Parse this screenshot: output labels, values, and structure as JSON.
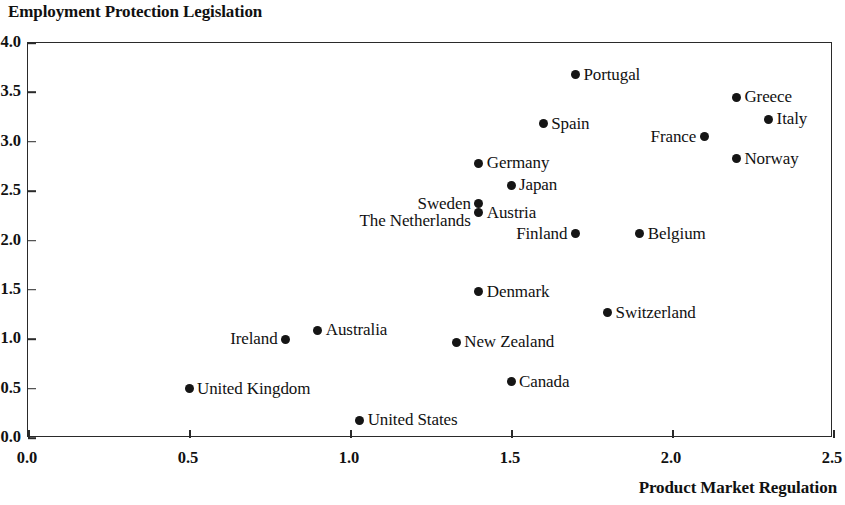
{
  "chart_data": {
    "type": "scatter",
    "title": "Employment Protection Legislation",
    "xlabel": "Product Market Regulation",
    "ylabel": "Employment Protection Legislation",
    "xlim": [
      0.0,
      2.5
    ],
    "ylim": [
      0.0,
      4.0
    ],
    "xticks": [
      "0.0",
      "0.5",
      "1.0",
      "1.5",
      "2.0",
      "2.5"
    ],
    "yticks": [
      "0.0",
      "0.5",
      "1.0",
      "1.5",
      "2.0",
      "2.5",
      "3.0",
      "3.5",
      "4.0"
    ],
    "grid": false,
    "legend": "none",
    "marker_color": "#151515",
    "axis_color": "#2a2a2a",
    "points": [
      {
        "label": "Portugal",
        "x": 1.7,
        "y": 3.68,
        "label_side": "right"
      },
      {
        "label": "Greece",
        "x": 2.2,
        "y": 3.45,
        "label_side": "right"
      },
      {
        "label": "Italy",
        "x": 2.3,
        "y": 3.23,
        "label_side": "right"
      },
      {
        "label": "Spain",
        "x": 1.6,
        "y": 3.18,
        "label_side": "right"
      },
      {
        "label": "France",
        "x": 2.1,
        "y": 3.05,
        "label_side": "left"
      },
      {
        "label": "Norway",
        "x": 2.2,
        "y": 2.83,
        "label_side": "right"
      },
      {
        "label": "Germany",
        "x": 1.4,
        "y": 2.78,
        "label_side": "right"
      },
      {
        "label": "Japan",
        "x": 1.5,
        "y": 2.56,
        "label_side": "right"
      },
      {
        "label": "Sweden",
        "x": 1.4,
        "y": 2.37,
        "label_side": "left"
      },
      {
        "label": "Austria",
        "x": 1.4,
        "y": 2.28,
        "label_side": "right"
      },
      {
        "label": "The Netherlands",
        "x": 1.4,
        "y": 2.2,
        "label_side": "left",
        "hide_marker": true
      },
      {
        "label": "Belgium",
        "x": 1.9,
        "y": 2.07,
        "label_side": "right"
      },
      {
        "label": "Finland",
        "x": 1.7,
        "y": 2.07,
        "label_side": "left"
      },
      {
        "label": "Denmark",
        "x": 1.4,
        "y": 1.48,
        "label_side": "right"
      },
      {
        "label": "Switzerland",
        "x": 1.8,
        "y": 1.27,
        "label_side": "right"
      },
      {
        "label": "Australia",
        "x": 0.9,
        "y": 1.09,
        "label_side": "right"
      },
      {
        "label": "Ireland",
        "x": 0.8,
        "y": 1.0,
        "label_side": "left"
      },
      {
        "label": "New Zealand",
        "x": 1.33,
        "y": 0.97,
        "label_side": "right"
      },
      {
        "label": "Canada",
        "x": 1.5,
        "y": 0.57,
        "label_side": "right"
      },
      {
        "label": "United Kingdom",
        "x": 0.5,
        "y": 0.5,
        "label_side": "right"
      },
      {
        "label": "United States",
        "x": 1.03,
        "y": 0.18,
        "label_side": "right"
      }
    ]
  }
}
